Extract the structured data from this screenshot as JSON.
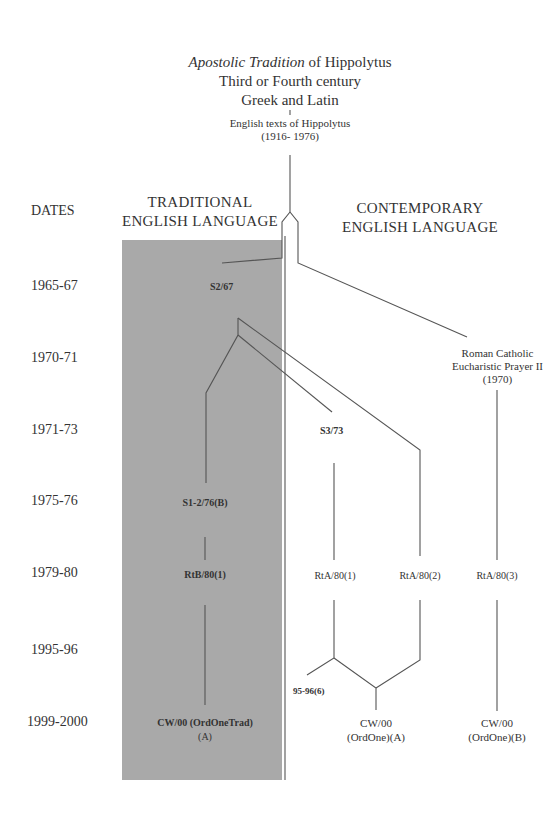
{
  "header": {
    "title_italic": "Apostolic Tradition",
    "title_rest": " of Hippolytus",
    "line2": "Third or Fourth century",
    "line3": "Greek and Latin",
    "english_texts": "English texts of Hippolytus",
    "english_texts_dates": "(1916- 1976)"
  },
  "columns": {
    "dates_label": "DATES",
    "traditional_line1": "TRADITIONAL",
    "traditional_line2": "ENGLISH LANGUAGE",
    "contemporary_line1": "CONTEMPORARY",
    "contemporary_line2": "ENGLISH LANGUAGE"
  },
  "dates": [
    "1965-67",
    "1970-71",
    "1971-73",
    "1975-76",
    "1979-80",
    "1995-96",
    "1999-2000"
  ],
  "nodes": {
    "s2_67": "S2/67",
    "rc_line1": "Roman Catholic",
    "rc_line2": "Eucharistic Prayer II",
    "rc_line3": "(1970)",
    "s3_73": "S3/73",
    "s1_2_76": "S1-2/76(B)",
    "rtb_80_1": "RtB/80(1)",
    "rta_80_1": "RtA/80(1)",
    "rta_80_2": "RtA/80(2)",
    "rta_80_3": "RtA/80(3)",
    "n95_96_6": "95-96(6)",
    "cw00_trad_line1": "CW/00 (OrdOneTrad)",
    "cw00_trad_line2": "(A)",
    "cw00_a_line1": "CW/00",
    "cw00_a_line2": "(OrdOne)(A)",
    "cw00_b_line1": "CW/00",
    "cw00_b_line2": "(OrdOne)(B)"
  },
  "colors": {
    "traditional_panel": "#a9a9a9",
    "lines": "#555555"
  }
}
